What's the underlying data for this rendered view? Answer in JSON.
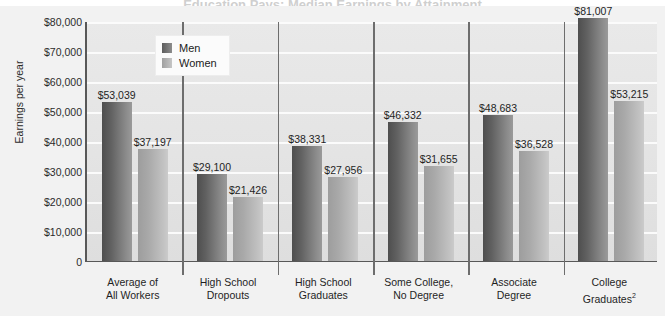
{
  "title_sliver": "Education Pays: Median Earnings by Attainment",
  "chart_data": {
    "type": "bar",
    "title": "",
    "xlabel": "",
    "ylabel": "Earnings per year",
    "ylim": [
      0,
      80000
    ],
    "ytick_labels": [
      "$80,000",
      "$70,000",
      "$60,000",
      "$50,000",
      "$40,000",
      "$30,000",
      "$20,000",
      "$10,000",
      "0"
    ],
    "ytick_values": [
      80000,
      70000,
      60000,
      50000,
      40000,
      30000,
      20000,
      10000,
      0
    ],
    "grid": true,
    "legend_position": "top-center-left",
    "categories": [
      "Average of All Workers",
      "High School Dropouts",
      "High School Graduates",
      "Some College, No Degree",
      "Associate Degree",
      "College Graduates"
    ],
    "category_lines": [
      [
        "Average of",
        "All Workers"
      ],
      [
        "High School",
        "Dropouts"
      ],
      [
        "High School",
        "Graduates"
      ],
      [
        "Some College,",
        "No Degree"
      ],
      [
        "Associate",
        "Degree"
      ],
      [
        "College",
        "Graduates"
      ]
    ],
    "category_footnotes": [
      "",
      "",
      "",
      "",
      "",
      "2"
    ],
    "series": [
      {
        "name": "Men",
        "color": "#6b6b6b",
        "values": [
          53039,
          29100,
          38331,
          46332,
          48683,
          81007
        ],
        "labels": [
          "$53,039",
          "$29,100",
          "$38,331",
          "$46,332",
          "$48,683",
          "$81,007"
        ]
      },
      {
        "name": "Women",
        "color": "#b4b4b4",
        "values": [
          37197,
          21426,
          27956,
          31655,
          36528,
          53215
        ],
        "labels": [
          "$37,197",
          "$21,426",
          "$27,956",
          "$31,655",
          "$36,528",
          "$53,215"
        ]
      }
    ]
  }
}
